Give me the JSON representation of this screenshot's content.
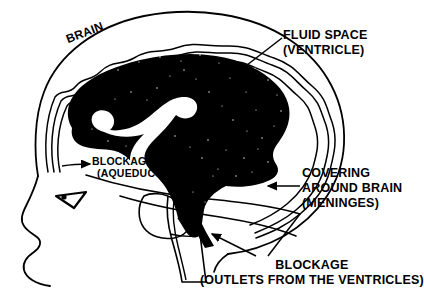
{
  "figure": {
    "ink_color": "#000000",
    "background_color": "#ffffff"
  },
  "labels": {
    "brain": "BRAIN",
    "fluid_space": {
      "line1": "FLUID SPACE",
      "line2": "(VENTRICLE)"
    },
    "covering": {
      "line1": "COVERING",
      "line2": "AROUND BRAIN",
      "line3": "(MENINGES)"
    },
    "blockage_aqueduct": {
      "line1": "BLOCKAGE",
      "arrow": "→",
      "line2": "(AQUEDUCT)"
    },
    "blockage_outlets": {
      "line1": "BLOCKAGE",
      "line2": "(OUTLETS FROM THE VENTRICLES)"
    }
  },
  "parts": {
    "skull_outline": "skull-outline",
    "meninges_layers": "meninges-wavy-layers",
    "brain_mass": "brain-mass-silhouette",
    "ventricle_channel": "ventricle-white-channel",
    "cerebellum": "cerebellum",
    "brainstem": "brainstem-spinal-cord",
    "eye": "eye",
    "face_profile": "face-profile",
    "fourth_ventricle_outlet": "fourth-ventricle-outlet"
  }
}
